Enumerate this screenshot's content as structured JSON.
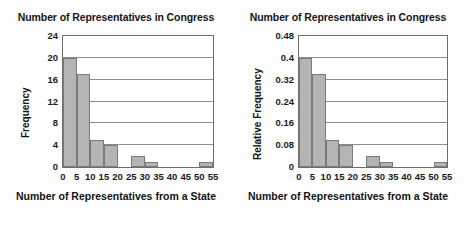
{
  "charts": [
    {
      "id": "frequency-histogram",
      "title": "Number of Representatives in Congress",
      "xlabel": "Number of Representatives from a State",
      "ylabel": "Frequency"
    },
    {
      "id": "relative-frequency-histogram",
      "title": "Number of Representatives in Congress",
      "xlabel": "Number of Representatives from a State",
      "ylabel": "Relative Frequency"
    }
  ],
  "chart_data": [
    {
      "type": "bar",
      "title": "Number of Representatives in Congress",
      "xlabel": "Number of Representatives from a State",
      "ylabel": "Frequency",
      "bin_width": 5,
      "bin_edges": [
        0,
        5,
        10,
        15,
        20,
        25,
        30,
        35,
        40,
        45,
        50,
        55
      ],
      "categories": [
        "0-5",
        "5-10",
        "10-15",
        "15-20",
        "20-25",
        "25-30",
        "30-35",
        "35-40",
        "40-45",
        "45-50",
        "50-55"
      ],
      "values": [
        20,
        17,
        5,
        4,
        0,
        2,
        1,
        0,
        0,
        0,
        1
      ],
      "xticks": [
        0,
        5,
        10,
        15,
        20,
        25,
        30,
        35,
        40,
        45,
        50,
        55
      ],
      "xtick_labels": [
        "0",
        "5",
        "10",
        "15",
        "20",
        "25",
        "30",
        "35",
        "40",
        "45",
        "50",
        "55"
      ],
      "yticks": [
        0,
        4,
        8,
        12,
        16,
        20,
        24
      ],
      "ytick_labels": [
        "0",
        "4",
        "8",
        "12",
        "16",
        "20",
        "24"
      ],
      "xlim": [
        0,
        55
      ],
      "ylim": [
        0,
        24
      ],
      "grid": "horizontal",
      "legend": "none",
      "bar_color": "#b4b4b4",
      "bar_edge_color": "#7a7a7a"
    },
    {
      "type": "bar",
      "title": "Number of Representatives in Congress",
      "xlabel": "Number of Representatives from a State",
      "ylabel": "Relative Frequency",
      "bin_width": 5,
      "bin_edges": [
        0,
        5,
        10,
        15,
        20,
        25,
        30,
        35,
        40,
        45,
        50,
        55
      ],
      "categories": [
        "0-5",
        "5-10",
        "10-15",
        "15-20",
        "20-25",
        "25-30",
        "30-35",
        "35-40",
        "40-45",
        "45-50",
        "50-55"
      ],
      "values": [
        0.4,
        0.34,
        0.1,
        0.08,
        0,
        0.04,
        0.02,
        0,
        0,
        0,
        0.02
      ],
      "xticks": [
        0,
        5,
        10,
        15,
        20,
        25,
        30,
        35,
        40,
        45,
        50,
        55
      ],
      "xtick_labels": [
        "0",
        "5",
        "10",
        "15",
        "20",
        "25",
        "30",
        "35",
        "40",
        "45",
        "50",
        "55"
      ],
      "yticks": [
        0,
        0.08,
        0.16,
        0.24,
        0.32,
        0.4,
        0.48
      ],
      "ytick_labels": [
        "0",
        "0.08",
        "0.16",
        "0.24",
        "0.32",
        "0.4",
        "0.48"
      ],
      "xlim": [
        0,
        55
      ],
      "ylim": [
        0,
        0.48
      ],
      "grid": "horizontal",
      "legend": "none",
      "bar_color": "#b4b4b4",
      "bar_edge_color": "#7a7a7a"
    }
  ]
}
